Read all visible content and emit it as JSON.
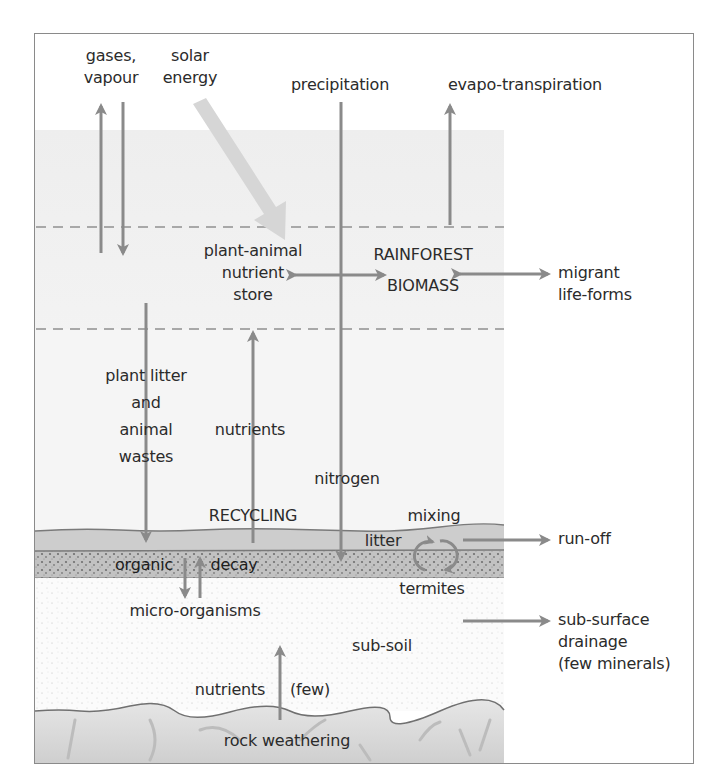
{
  "diagram": {
    "colors": {
      "arrow": "#8a8a8a",
      "solar_arrow": "#d4d4d4",
      "canopy_band": "#f2f2f2",
      "litter_layer": "#cfcfcf",
      "organic_layer": "#bdbdbd",
      "subsoil": "#fbfbfb",
      "bedrock": "#dcdcdc",
      "frame": "#8a8a8a"
    },
    "labels": {
      "gases": [
        "gases,",
        "vapour"
      ],
      "solar": [
        "solar",
        "energy"
      ],
      "precipitation": "precipitation",
      "evapotranspiration": "evapo-transpiration",
      "plant_animal_store": [
        "plant-animal",
        "nutrient",
        "store"
      ],
      "rainforest_biomass": [
        "RAINFOREST",
        "BIOMASS"
      ],
      "migrant": [
        "migrant",
        "life-forms"
      ],
      "plant_litter": [
        "plant litter",
        "and",
        "animal",
        "wastes"
      ],
      "nutrients_upper": "nutrients",
      "nitrogen": "nitrogen",
      "recycling": "RECYCLING",
      "mixing": "mixing",
      "litter": "litter",
      "run_off": "run-off",
      "organic": "organic",
      "decay": "decay",
      "termites": "termites",
      "micro_organisms": "micro-organisms",
      "sub_surface": [
        "sub-surface",
        "drainage",
        "(few minerals)"
      ],
      "sub_soil": "sub-soil",
      "nutrients_lower": "nutrients",
      "few": "(few)",
      "rock_weathering": "rock weathering"
    }
  }
}
